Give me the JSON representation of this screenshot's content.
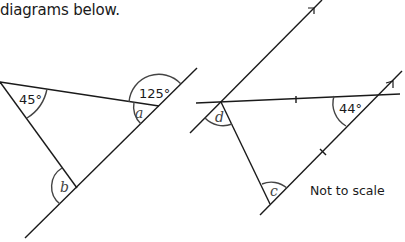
{
  "header": {
    "text": "diagrams below."
  },
  "diagram_left": {
    "angles": {
      "given_top_left": "45°",
      "given_top_right": "125°",
      "unknown_a": "a",
      "unknown_b": "b"
    }
  },
  "diagram_right": {
    "angles": {
      "given": "44°",
      "unknown_c": "c",
      "unknown_d": "d"
    },
    "note": "Not to scale"
  },
  "colors": {
    "line": "#1a1a1a",
    "arc": "#444444"
  }
}
